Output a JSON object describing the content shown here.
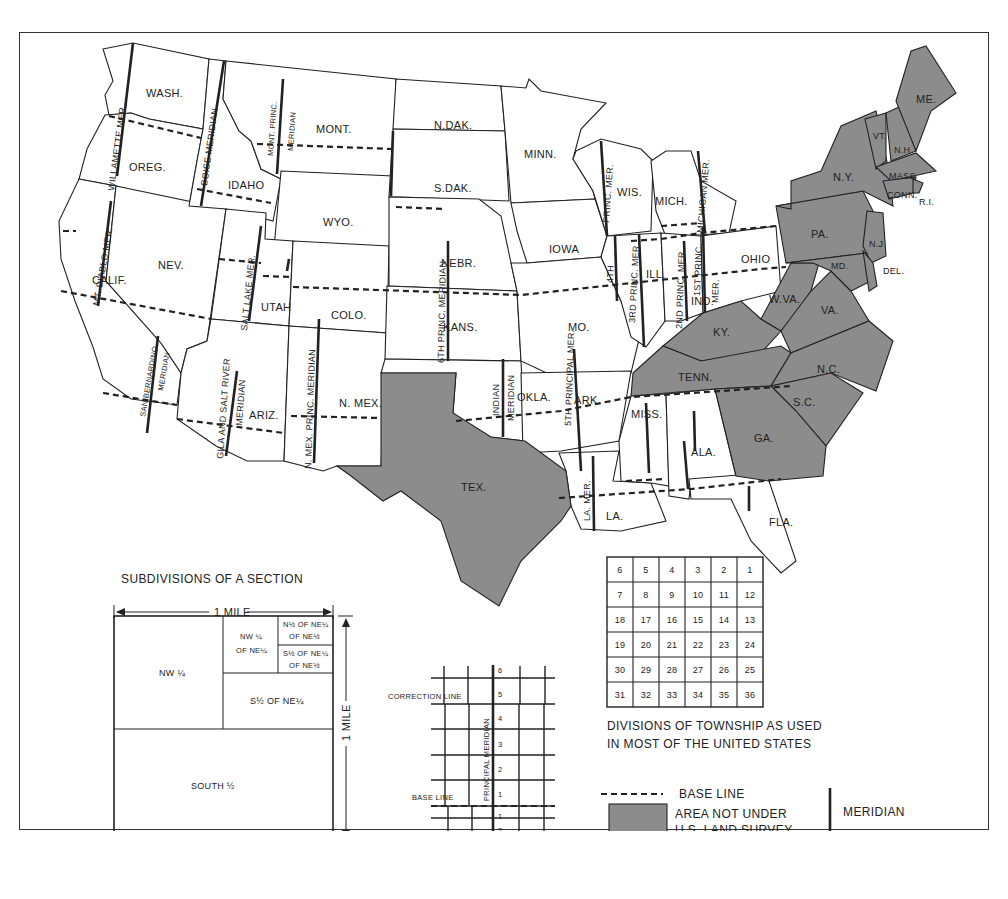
{
  "figure": {
    "type": "map",
    "fill_color_not_surveyed": "#8c8c8c"
  },
  "states": {
    "surveyed": [
      "WASH.",
      "OREG.",
      "CALIF.",
      "NEV.",
      "IDAHO",
      "MONT.",
      "WYO.",
      "UTAH",
      "COLO.",
      "ARIZ.",
      "N. MEX.",
      "N.DAK.",
      "S.DAK.",
      "NEBR.",
      "KANS.",
      "OKLA.",
      "MINN.",
      "IOWA",
      "MO.",
      "ARK.",
      "LA.",
      "WIS.",
      "MICH.",
      "ILL.",
      "IND.",
      "OHIO",
      "MISS.",
      "ALA.",
      "FLA."
    ],
    "not_surveyed": [
      "TEX.",
      "KY.",
      "TENN.",
      "W.VA.",
      "VA.",
      "N.C.",
      "S.C.",
      "GA.",
      "PA.",
      "N.Y.",
      "N.J.",
      "DEL.",
      "MD.",
      "VT.",
      "N.H.",
      "ME.",
      "MASS.",
      "CONN.",
      "R.I."
    ]
  },
  "labels": {
    "wash": "WASH.",
    "oreg": "OREG.",
    "calif": "CALIF.",
    "nev": "NEV.",
    "idaho": "IDAHO",
    "mont": "MONT.",
    "wyo": "WYO.",
    "utah": "UTAH",
    "colo": "COLO.",
    "ariz": "ARIZ.",
    "nmex": "N. MEX.",
    "ndak": "N.DAK.",
    "sdak": "S.DAK.",
    "nebr": "NEBR.",
    "kans": "KANS.",
    "okla": "OKLA.",
    "tex": "TEX.",
    "minn": "MINN.",
    "iowa": "IOWA",
    "mo": "MO.",
    "ark": "ARK.",
    "la": "LA.",
    "wis": "WIS.",
    "mich": "MICH.",
    "ill": "ILL.",
    "ind": "IND.",
    "ohio": "OHIO",
    "ky": "KY.",
    "tenn": "TENN.",
    "miss": "MISS.",
    "ala": "ALA.",
    "ga": "GA.",
    "fla": "FLA.",
    "sc": "S.C.",
    "nc": "N.C.",
    "va": "VA.",
    "wva": "W.VA.",
    "md": "MD.",
    "del": "DEL.",
    "nj": "N.J",
    "pa": "PA.",
    "ny": "N.Y.",
    "vt": "VT.",
    "nh": "N.H.",
    "me": "ME.",
    "mass": "MASS",
    "conn": "CONN.",
    "ri": "R.I."
  },
  "meridians": {
    "willamette": "WILLAMETTE MER.",
    "boise": "BOISE MERIDIAN",
    "mont_princ_1": "MONT. PRINC.",
    "mont_princ_2": "MERIDIAN",
    "mt_diablo": "MT. DIABLO MER.",
    "salt_lake": "SALT LAKE MER.",
    "san_bern_1": "SAN BERNARDINO",
    "san_bern_2": "MERIDIAN",
    "gila_1": "GILA AND SALT RIVER",
    "gila_2": "MERIDIAN",
    "nmex_1": "N. MEX.  PRINC. MERIDIAN",
    "sixth": "6TH PRINC. MERIDIAN",
    "indian_1": "INDIAN",
    "indian_2": "MERIDIAN",
    "fifth": "5TH PRINCIPAL MER.",
    "fourth_princ": "PRINC. MER.",
    "fourth": "4TH",
    "third": "3RD PRINC. MER.",
    "second": "2ND PRINC. MER.",
    "first_1": "1ST PRINC.",
    "first_2": "MER.",
    "michigan": "MICHIGAN MER.",
    "la_mer": "LA. MER."
  },
  "section_diagram": {
    "title": "SUBDIVISIONS OF A SECTION",
    "width_label": "1 MILE",
    "height_label": "1 MILE",
    "parts": {
      "nw": "NW ¼",
      "nw_ne_1": "NW ¼",
      "nw_ne_2": "OF NE¼",
      "n_ne_ne_1": "N½ OF NE¼",
      "n_ne_ne_2": "OF NE½",
      "s_ne_ne_1": "S½ OF NE¼",
      "s_ne_ne_2": "OF NE½",
      "s_ne": "S½ OF NE¼",
      "south": "SOUTH ½"
    }
  },
  "township_grid_diagram": {
    "correction_line": "CORRECTION LINE",
    "base_line": "BASE LINE",
    "principal_meridian": "PRINCIPAL MERIDIAN",
    "tiers_north": [
      "6",
      "5",
      "4",
      "3",
      "2",
      "1"
    ],
    "tiers_south": [
      "1",
      "2"
    ]
  },
  "township_sections": {
    "rows": [
      [
        "6",
        "5",
        "4",
        "3",
        "2",
        "1"
      ],
      [
        "7",
        "8",
        "9",
        "10",
        "11",
        "12"
      ],
      [
        "18",
        "17",
        "16",
        "15",
        "14",
        "13"
      ],
      [
        "19",
        "20",
        "21",
        "22",
        "23",
        "24"
      ],
      [
        "30",
        "29",
        "28",
        "27",
        "26",
        "25"
      ],
      [
        "31",
        "32",
        "33",
        "34",
        "35",
        "36"
      ]
    ],
    "caption_1": "DIVISIONS OF TOWNSHIP AS USED",
    "caption_2": "IN MOST OF THE UNITED STATES"
  },
  "legend": {
    "base_line": "BASE LINE",
    "not_surveyed_1": "AREA NOT UNDER",
    "not_surveyed_2": "U.S. LAND SURVEY",
    "meridian": "MERIDIAN"
  }
}
